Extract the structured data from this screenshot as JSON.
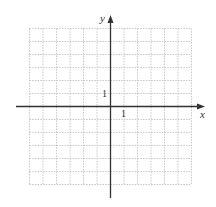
{
  "chart_data": {
    "type": "scatter",
    "title": "",
    "xlabel": "x",
    "ylabel": "y",
    "xlim": [
      -6,
      6
    ],
    "ylim": [
      -6,
      6
    ],
    "grid": true,
    "grid_style": "dotted",
    "tick_labels": {
      "x": [
        "1"
      ],
      "y": [
        "1"
      ]
    },
    "series": []
  },
  "axes": {
    "x_label": "x",
    "y_label": "y",
    "x_tick_label": "1",
    "y_tick_label": "1"
  },
  "colors": {
    "axis": "#333333",
    "grid": "#c8c8c8",
    "background": "#ffffff"
  }
}
